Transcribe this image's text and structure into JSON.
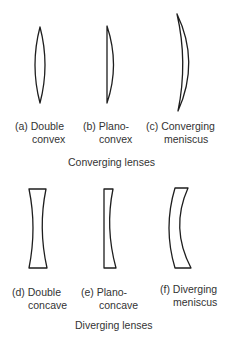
{
  "figure": {
    "converging": {
      "caption": "Converging lenses",
      "lenses": [
        {
          "id": "a",
          "prefix": "(a)",
          "line1": "Double",
          "line2": "convex"
        },
        {
          "id": "b",
          "prefix": "(b)",
          "line1": "Plano-",
          "line2": "convex"
        },
        {
          "id": "c",
          "prefix": "(c)",
          "line1": "Converging",
          "line2": "meniscus"
        }
      ]
    },
    "diverging": {
      "caption": "Diverging lenses",
      "lenses": [
        {
          "id": "d",
          "prefix": "(d)",
          "line1": "Double",
          "line2": "concave"
        },
        {
          "id": "e",
          "prefix": "(e)",
          "line1": "Plano-",
          "line2": "concave"
        },
        {
          "id": "f",
          "prefix": "(f)",
          "line1": "Diverging",
          "line2": "meniscus"
        }
      ]
    }
  }
}
